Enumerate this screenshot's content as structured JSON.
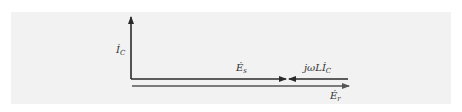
{
  "diagram": {
    "type": "phasor-diagram",
    "vectors": [
      {
        "id": "Ic",
        "label": "İ",
        "subscript": "C",
        "direction": "up"
      },
      {
        "id": "Es",
        "label": "Ė",
        "subscript": "s",
        "direction": "right"
      },
      {
        "id": "jwLIc",
        "label": "jωLİ",
        "subscript": "C",
        "direction": "left"
      },
      {
        "id": "Er",
        "label": "Ė",
        "subscript": "r",
        "direction": "right"
      }
    ],
    "colors": {
      "background": "#f2f2f2",
      "vector": "#2a2a2a",
      "er_vector": "#555555"
    }
  }
}
